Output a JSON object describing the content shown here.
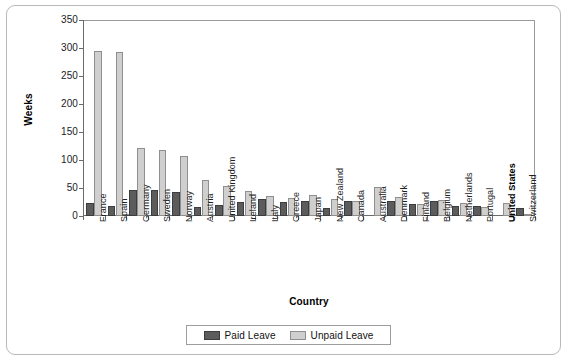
{
  "chart_data": {
    "type": "bar",
    "title": "",
    "xlabel": "Country",
    "ylabel": "Weeks",
    "ylim": [
      0,
      350
    ],
    "yticks": [
      0,
      50,
      100,
      150,
      200,
      250,
      300,
      350
    ],
    "grid": false,
    "legend_position": "bottom",
    "categories": [
      "France",
      "Spain",
      "Germany",
      "Sweden",
      "Norway",
      "Austria",
      "United Kingdom",
      "Ireland",
      "Italy",
      "Greece",
      "Japan",
      "New Zealand",
      "Canada",
      "Australia",
      "Denmark",
      "Finland",
      "Belgium",
      "Netherlands",
      "Portugal",
      "United States",
      "Switzerland"
    ],
    "highlighted_category": "United States",
    "series": [
      {
        "name": "Paid Leave",
        "color": "#5c5c5c",
        "values": [
          24,
          17,
          47,
          47,
          43,
          16,
          20,
          25,
          30,
          25,
          27,
          15,
          27,
          0,
          26,
          22,
          26,
          17,
          17,
          0,
          14
        ]
      },
      {
        "name": "Unpaid Leave",
        "color": "#cfcfcf",
        "values": [
          295,
          293,
          122,
          118,
          107,
          65,
          53,
          44,
          35,
          32,
          38,
          30,
          27,
          52,
          34,
          21,
          29,
          23,
          16,
          24,
          2
        ]
      }
    ]
  },
  "legend": {
    "items": [
      {
        "label": "Paid Leave",
        "swatch": "paid"
      },
      {
        "label": "Unpaid Leave",
        "swatch": "unpaid"
      }
    ]
  }
}
